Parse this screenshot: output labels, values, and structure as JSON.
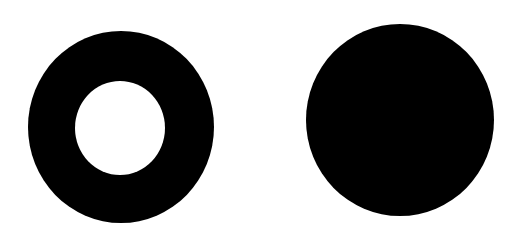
{
  "figure": {
    "background": "#ffffff",
    "shapes": [
      {
        "id": "ring",
        "label": "ring",
        "type": "annulus",
        "cx": 121,
        "cy": 127,
        "rx": 93,
        "ry": 96,
        "inner_rx": 45,
        "inner_ry": 47,
        "inner_cx": 120,
        "inner_cy": 128,
        "fill": "#000000",
        "hole_fill": "#ffffff"
      },
      {
        "id": "disk",
        "label": "disk",
        "type": "filled-circle",
        "cx": 400,
        "cy": 120,
        "rx": 94,
        "ry": 96,
        "fill": "#000000"
      }
    ]
  }
}
